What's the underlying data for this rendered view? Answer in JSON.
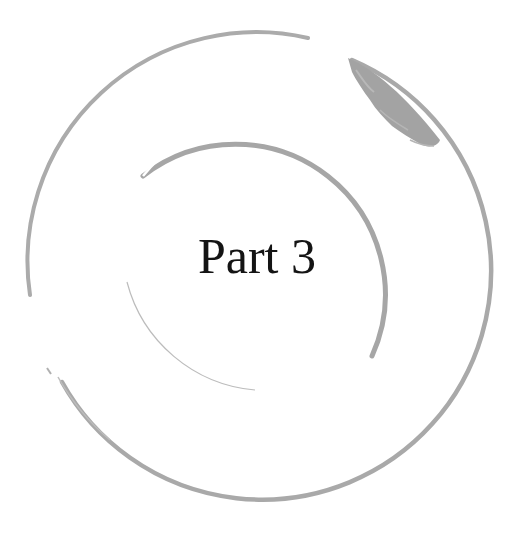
{
  "page": {
    "title": "Part 3"
  },
  "ornament": {
    "icon": "concentric-brush-circles",
    "stroke_color": "#a8a8a8",
    "blob_color": "#9e9e9e"
  },
  "colors": {
    "background": "#ffffff",
    "text": "#141414"
  }
}
